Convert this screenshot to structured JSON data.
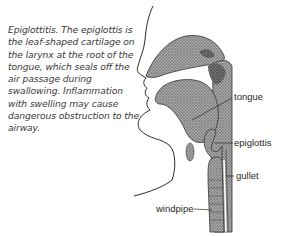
{
  "caption": {
    "text": "Epiglottitis. The epiglottis is the leaf-shaped cartilage on the larynx at the root of the tongue, which seals off the air passage during swallowing. Inflammation with swelling may cause dangerous obstruction to the airway."
  },
  "labels": {
    "tongue": "tongue",
    "epiglottis": "epiglottis",
    "gullet": "gullet",
    "windpipe": "windpipe"
  },
  "colors": {
    "ink": "#2a2a2a",
    "tissue": "#8c8c8c",
    "tissue_dark": "#5a5a5a",
    "background": "#ffffff"
  }
}
